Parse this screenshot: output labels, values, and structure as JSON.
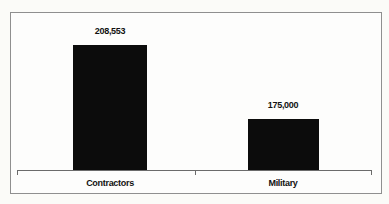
{
  "figure": {
    "page_background": "#fbfbf8",
    "frame_border_color": "#8f8f8f",
    "frame_background": "#fdfdfc"
  },
  "chart_data": {
    "type": "bar",
    "title": "",
    "categories": [
      "Contractors",
      "Military"
    ],
    "values": [
      208553,
      175000
    ],
    "value_labels": [
      "208,553",
      "175,000"
    ],
    "bar_color": "#0c0c0c",
    "axis_color": "#6b6b6b",
    "text_color": "#111111",
    "grid": false,
    "legend": false,
    "layout": {
      "axis_y_px": 157,
      "value_label_offset_px": 18,
      "bars": [
        {
          "left_px": 62,
          "width_px": 74,
          "height_px": 125,
          "center_px": 99
        },
        {
          "left_px": 237,
          "width_px": 71,
          "height_px": 51,
          "center_px": 272
        }
      ]
    }
  }
}
